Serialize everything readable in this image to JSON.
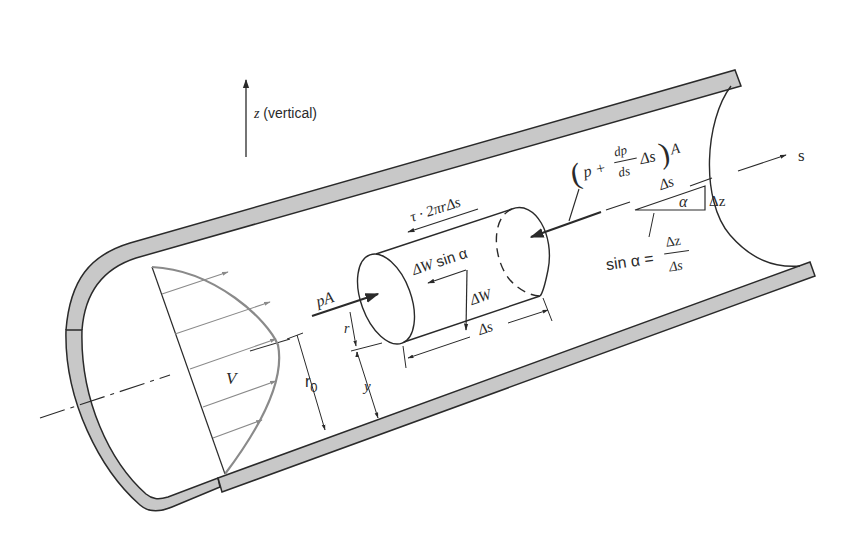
{
  "figure": {
    "colors": {
      "line": "#2a2a2a",
      "pipe_wall_fill": "#c8c8c8",
      "profile": "#8a8a8a",
      "background": "#ffffff"
    }
  },
  "labels": {
    "vertical_axis": {
      "var": "z",
      "text": " (vertical)"
    },
    "s_axis": "s",
    "velocity": "V",
    "radius_pipe": {
      "base": "r",
      "sub": "0"
    },
    "radius_element": "r",
    "y_distance": "y",
    "pressure_force_left": "pA",
    "shear_force": "τ · 2πrΔs",
    "weight": "ΔW",
    "weight_component": {
      "main": "ΔW",
      "func": "sin α"
    },
    "element_length": "Δs",
    "pressure_force_right": {
      "open": "(",
      "p": "p + ",
      "frac_num": "dp",
      "frac_den": "ds",
      "tail": "Δs",
      "close": ")",
      "area": "A"
    },
    "slope_triangle": {
      "hyp": "Δs",
      "angle": "α",
      "rise": "Δz"
    },
    "sine_relation": {
      "lhs": "sin α = ",
      "num": "Δz",
      "den": "Δs"
    }
  }
}
